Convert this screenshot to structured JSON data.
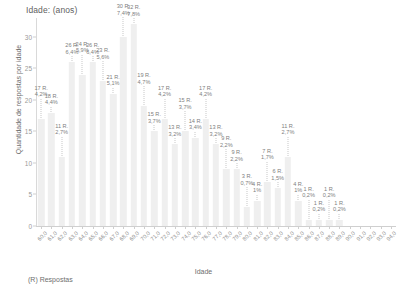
{
  "chart_data": {
    "type": "bar",
    "title": "Idade: (anos)",
    "subtitle": "",
    "xlabel": "Idade",
    "ylabel": "Quantidade de respostas por idade",
    "footer": "(R) Respostas",
    "grid": false,
    "legend": "none",
    "ylim": [
      0,
      33
    ],
    "yticks": [
      "0",
      "5",
      "10",
      "15",
      "20",
      "25",
      "30"
    ],
    "ytick_values": [
      0,
      5,
      10,
      15,
      20,
      25,
      30
    ],
    "categories": [
      "60,0",
      "61,0",
      "62,0",
      "63,0",
      "64,0",
      "65,0",
      "66,0",
      "67,0",
      "68,0",
      "69,0",
      "70,0",
      "71,0",
      "72,0",
      "73,0",
      "74,0",
      "75,0",
      "76,0",
      "77,0",
      "78,0",
      "79,0",
      "80,0",
      "81,0",
      "82,0",
      "83,0",
      "84,0",
      "85,0",
      "86,0",
      "87,0",
      "88,0",
      "89,0",
      "90,0",
      "91,0",
      "92,0",
      "93,0",
      "94,0"
    ],
    "values": [
      17,
      18,
      11,
      26,
      24,
      26,
      23,
      21,
      30,
      32,
      19,
      15,
      17,
      13,
      15,
      14,
      17,
      13,
      9,
      9,
      3,
      4,
      7,
      6,
      11,
      4,
      1,
      1,
      1,
      1,
      0,
      0,
      0,
      0,
      0
    ],
    "count_labels": [
      "17 R.",
      "18 R.",
      "11 R.",
      "26 R.",
      "24 R.",
      "26 R.",
      "23 R.",
      "21 R.",
      "30 R.",
      "32 R.",
      "19 R.",
      "15 R.",
      "17 R.",
      "13 R.",
      "15 R.",
      "14 R.",
      "17 R.",
      "13 R.",
      "9 R.",
      "9 R.",
      "3 R.",
      "4 R.",
      "7 R.",
      "6 R.",
      "11 R.",
      "4 R.",
      "1 R.",
      "1 R.",
      "1 R.",
      "1 R.",
      "",
      "",
      "",
      "",
      ""
    ],
    "percent_labels": [
      "4,2%",
      "4,4%",
      "2,7%",
      "6,4%",
      "5,9%",
      "6,4%",
      "5,6%",
      "5,1%",
      "7,4%",
      "7,8%",
      "4,7%",
      "3,7%",
      "4,2%",
      "3,2%",
      "3,7%",
      "3,4%",
      "4,2%",
      "3,2%",
      "2,2%",
      "2,2%",
      "0,7%",
      "1%",
      "1,7%",
      "1,5%",
      "2,7%",
      "1%",
      "0,2%",
      "0,2%",
      "0,2%",
      "0,2%",
      "",
      "",
      "",
      "",
      ""
    ],
    "bar_color": "#efefef",
    "text_color": "#808080",
    "axis_color": "#cfcfcf"
  }
}
